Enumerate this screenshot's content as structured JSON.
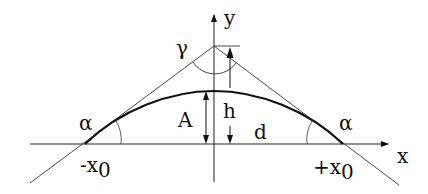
{
  "diagram": {
    "type": "geometry",
    "axes": {
      "x_label": "x",
      "y_label": "y"
    },
    "labels": {
      "gamma": "γ",
      "alpha_left": "α",
      "alpha_right": "α",
      "A": "A",
      "h": "h",
      "d": "d",
      "neg_x0_main": "-x",
      "neg_x0_sub": "0",
      "pos_x0_main": "+x",
      "pos_x0_sub": "0"
    },
    "colors": {
      "stroke": "#222222",
      "curve": "#111111",
      "background": "#ffffff"
    }
  }
}
